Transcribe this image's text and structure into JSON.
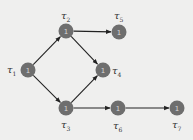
{
  "diagram": {
    "type": "task-graph",
    "nodes": [
      {
        "id": "t1",
        "label_base": "τ",
        "label_sub": "1",
        "value": "1"
      },
      {
        "id": "t2",
        "label_base": "τ",
        "label_sub": "2",
        "value": "1"
      },
      {
        "id": "t3",
        "label_base": "τ",
        "label_sub": "3",
        "value": "1"
      },
      {
        "id": "t4",
        "label_base": "τ",
        "label_sub": "4",
        "value": "1"
      },
      {
        "id": "t5",
        "label_base": "τ",
        "label_sub": "5",
        "value": "1"
      },
      {
        "id": "t6",
        "label_base": "τ",
        "label_sub": "6",
        "value": "1"
      },
      {
        "id": "t7",
        "label_base": "τ",
        "label_sub": "7",
        "value": "1"
      }
    ],
    "edges": [
      {
        "from": "t1",
        "to": "t2"
      },
      {
        "from": "t1",
        "to": "t3"
      },
      {
        "from": "t2",
        "to": "t5"
      },
      {
        "from": "t2",
        "to": "t4"
      },
      {
        "from": "t3",
        "to": "t4"
      },
      {
        "from": "t3",
        "to": "t6"
      },
      {
        "from": "t6",
        "to": "t7"
      }
    ],
    "colors": {
      "node_fill": "#6e6e6e",
      "edge": "#222222",
      "background": "#efefee"
    }
  }
}
